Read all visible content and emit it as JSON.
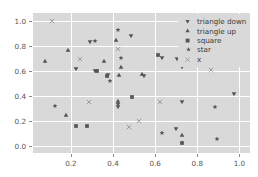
{
  "chart_data": {
    "type": "scatter",
    "title": "",
    "xlabel": "",
    "ylabel": "",
    "xlim": [
      0.02,
      1.05
    ],
    "ylim": [
      -0.06,
      1.06
    ],
    "xticks": [
      0.2,
      0.4,
      0.6,
      0.8,
      1.0
    ],
    "yticks": [
      0.0,
      0.2,
      0.4,
      0.6,
      0.8,
      1.0
    ],
    "xticklabels": [
      "0.2",
      "0.4",
      "0.6",
      "0.8",
      "1.0"
    ],
    "yticklabels": [
      "0.0",
      "0.2",
      "0.4",
      "0.6",
      "0.8",
      "1.0"
    ],
    "grid": true,
    "legend_position": "upper right",
    "marker_color": "#555555",
    "background_color": "#d9d9d9",
    "gridline_color": "#ffffff",
    "series": [
      {
        "name": "triangle down",
        "marker": "triangle-down",
        "points": [
          [
            0.29,
            0.83
          ],
          [
            0.485,
            0.88
          ],
          [
            0.225,
            0.61
          ],
          [
            0.375,
            0.565
          ],
          [
            0.545,
            0.555
          ],
          [
            0.705,
            0.695
          ],
          [
            0.725,
            0.625
          ],
          [
            0.63,
            0.7
          ],
          [
            0.425,
            0.31
          ],
          [
            0.725,
            0.35
          ],
          [
            0.7,
            0.135
          ],
          [
            0.975,
            0.415
          ],
          [
            0.315,
            0.6
          ]
        ]
      },
      {
        "name": "triangle up",
        "marker": "triangle-up",
        "points": [
          [
            0.075,
            0.68
          ],
          [
            0.185,
            0.765
          ],
          [
            0.415,
            0.845
          ],
          [
            0.355,
            0.675
          ],
          [
            0.44,
            0.625
          ],
          [
            0.425,
            0.355
          ],
          [
            0.535,
            0.575
          ],
          [
            0.175,
            0.245
          ],
          [
            0.725,
            0.085
          ],
          [
            0.43,
            0.565
          ]
        ]
      },
      {
        "name": "square",
        "marker": "square",
        "points": [
          [
            0.325,
            0.595
          ],
          [
            0.37,
            0.555
          ],
          [
            0.615,
            0.725
          ],
          [
            0.225,
            0.155
          ],
          [
            0.275,
            0.155
          ],
          [
            0.725,
            0.02
          ],
          [
            0.49,
            0.39
          ]
        ]
      },
      {
        "name": "star",
        "marker": "star",
        "points": [
          [
            0.315,
            0.84
          ],
          [
            0.425,
            0.925
          ],
          [
            0.44,
            0.7
          ],
          [
            0.385,
            0.515
          ],
          [
            0.125,
            0.32
          ],
          [
            0.425,
            0.335
          ],
          [
            0.63,
            0.1
          ],
          [
            0.885,
            0.31
          ],
          [
            0.895,
            0.05
          ]
        ]
      },
      {
        "name": "x",
        "marker": "x",
        "points": [
          [
            0.11,
            1.0
          ],
          [
            0.245,
            0.695
          ],
          [
            0.745,
            0.695
          ],
          [
            0.285,
            0.35
          ],
          [
            0.625,
            0.345
          ],
          [
            0.525,
            0.2
          ],
          [
            0.475,
            0.15
          ],
          [
            0.865,
            0.605
          ],
          [
            0.425,
            0.775
          ]
        ]
      }
    ]
  },
  "legend": {
    "items": [
      {
        "label": "triangle down",
        "marker": "triangle-down"
      },
      {
        "label": "triangle up",
        "marker": "triangle-up"
      },
      {
        "label": "square",
        "marker": "square"
      },
      {
        "label": "star",
        "marker": "star"
      },
      {
        "label": "x",
        "marker": "x"
      }
    ]
  }
}
